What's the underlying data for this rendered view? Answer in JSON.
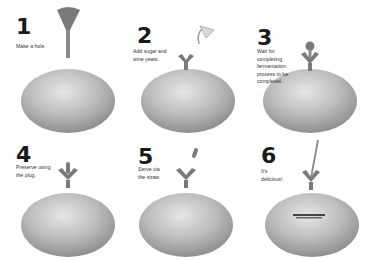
{
  "colors": {
    "melon": "#bdbdbd",
    "melon_shadow": "#8f8f8f",
    "tool": "#7a7a7a",
    "text": "#333333",
    "number": "#1a1a1a"
  },
  "steps": [
    {
      "number": "1",
      "caption": "Make a hole.",
      "tool": "hole-punch-icon"
    },
    {
      "number": "2",
      "caption": "Add sugar and\nwine yeast.",
      "tool": "funnel-icon"
    },
    {
      "number": "3",
      "caption": "Wait for\ncompleting\nfermentation\nprocess to be\ncompleted.",
      "tool": "airlock-icon"
    },
    {
      "number": "4",
      "caption": "Preserve using\nthe plug.",
      "tool": "plug-icon"
    },
    {
      "number": "5",
      "caption": "Serve via\nthe straw.",
      "tool": "straw-cap-icon"
    },
    {
      "number": "6",
      "caption": "It's\ndelicious!",
      "tool": "straw-icon"
    }
  ]
}
